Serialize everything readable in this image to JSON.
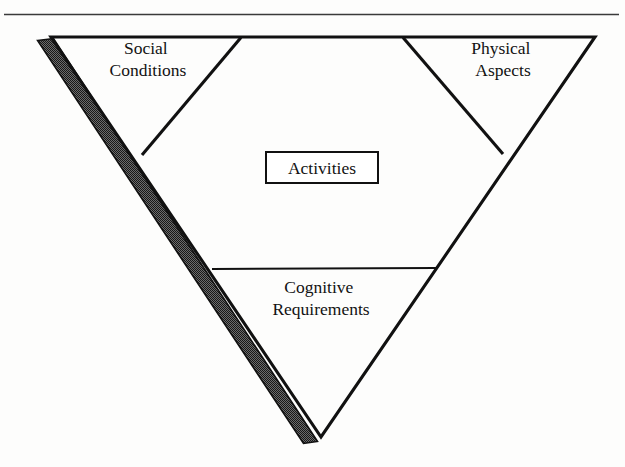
{
  "figure": {
    "type": "diagram",
    "shape": "inverted-triangle",
    "title_visible": false,
    "top_rule": {
      "present": true,
      "color": "#3a3a3a"
    },
    "colors": {
      "line": "#111111",
      "shade_band": "#4a4a4a",
      "background": "#fdfdfc",
      "text": "#121212"
    },
    "regions": [
      {
        "id": "social-conditions",
        "label_line1": "Social",
        "label_line2": "Conditions",
        "position": "top-left"
      },
      {
        "id": "physical-aspects",
        "label_line1": "Physical",
        "label_line2": "Aspects",
        "position": "top-right"
      },
      {
        "id": "cognitive-requirements",
        "label_line1": "Cognitive",
        "label_line2": "Requirements",
        "position": "bottom-center"
      }
    ],
    "center_box": {
      "id": "activities",
      "label": "Activities"
    },
    "shade_band": {
      "id": "left-edge-shading",
      "description": "shaded band along left outer edge"
    }
  }
}
